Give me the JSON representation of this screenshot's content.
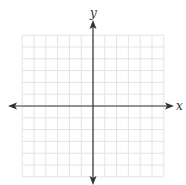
{
  "diagram": {
    "type": "coordinate-plane",
    "x_axis_label": "x",
    "y_axis_label": "y",
    "grid": {
      "columns_left": 6,
      "columns_right": 6,
      "rows_above": 6,
      "rows_below": 6
    },
    "axes_arrows": [
      "left",
      "right",
      "up",
      "down"
    ],
    "colors": {
      "grid_line": "#e4e4e4",
      "axis_line": "#333333",
      "label": "#333333"
    }
  }
}
